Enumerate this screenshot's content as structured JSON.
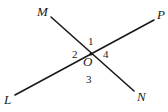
{
  "diagram": {
    "type": "intersecting-lines",
    "intersection": {
      "label": "O",
      "x": 91,
      "y": 54
    },
    "lines": [
      {
        "name": "MN",
        "from": {
          "label": "M",
          "x": 51,
          "y": 17
        },
        "to": {
          "label": "N",
          "x": 134,
          "y": 91
        }
      },
      {
        "name": "LP",
        "from": {
          "label": "L",
          "x": 15,
          "y": 95
        },
        "to": {
          "label": "P",
          "x": 154,
          "y": 20
        }
      }
    ],
    "points": {
      "M": {
        "label": "M",
        "x": 37,
        "y": 16
      },
      "P": {
        "label": "P",
        "x": 157,
        "y": 19
      },
      "L": {
        "label": "L",
        "x": 4,
        "y": 104
      },
      "N": {
        "label": "N",
        "x": 137,
        "y": 101
      },
      "O": {
        "label": "O",
        "x": 83,
        "y": 66
      }
    },
    "angles": [
      {
        "label": "1",
        "x": 88,
        "y": 45
      },
      {
        "label": "2",
        "x": 72,
        "y": 58
      },
      {
        "label": "3",
        "x": 86,
        "y": 83
      },
      {
        "label": "4",
        "x": 103,
        "y": 58
      }
    ]
  }
}
